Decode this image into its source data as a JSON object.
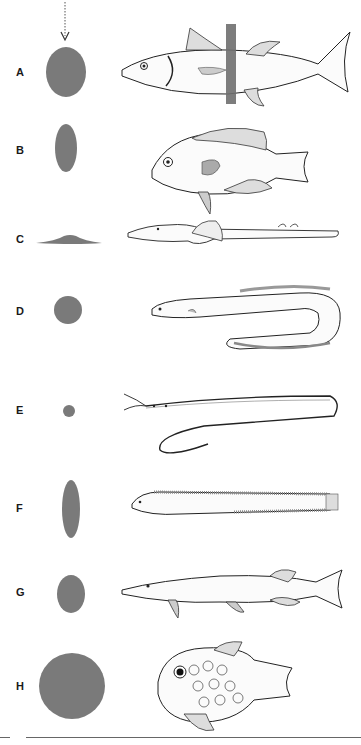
{
  "figure": {
    "title": "",
    "blob_color": "#7a7a7a",
    "arrow": {
      "icon": "dotted-arrow-down-icon",
      "target": "A"
    },
    "rows": [
      {
        "label": "A",
        "shape": "cross-section",
        "fish": "tuna-like fish with vertical cross-section band",
        "has_section_band": true
      },
      {
        "label": "B",
        "shape": "cross-section",
        "fish": "deep-bodied perch-like fish"
      },
      {
        "label": "C",
        "shape": "cross-section",
        "fish": "flattened sawfish-like fish"
      },
      {
        "label": "D",
        "shape": "cross-section",
        "fish": "eel"
      },
      {
        "label": "E",
        "shape": "cross-section",
        "fish": "slender snipe eel"
      },
      {
        "label": "F",
        "shape": "cross-section",
        "fish": "elongated compressed fish"
      },
      {
        "label": "G",
        "shape": "cross-section",
        "fish": "pike-like fish"
      },
      {
        "label": "H",
        "shape": "cross-section",
        "fish": "globular spiny fish"
      }
    ]
  }
}
